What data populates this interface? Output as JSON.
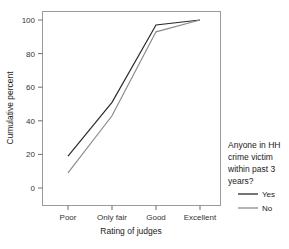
{
  "chart_data": {
    "type": "line",
    "title": "",
    "xlabel": "Rating of judges",
    "ylabel": "Cumulative percent",
    "categories": [
      "Poor",
      "Only fair",
      "Good",
      "Excellent"
    ],
    "ylim": [
      0,
      100
    ],
    "yticks": [
      0,
      20,
      40,
      60,
      80,
      100
    ],
    "ytick_labels": [
      "0",
      "20",
      "40",
      "60",
      "80",
      "100"
    ],
    "grid": false,
    "legend_position": "right",
    "legend_title": "Anyone in HH crime victim within past 3 years?",
    "series": [
      {
        "name": "Yes",
        "color": "#2b2b2b",
        "values": [
          19,
          51,
          97,
          100
        ]
      },
      {
        "name": "No",
        "color": "#8c8c8c",
        "values": [
          9,
          43,
          93,
          100
        ]
      }
    ]
  },
  "axes": {
    "y_tick_0": "0",
    "y_tick_1": "20",
    "y_tick_2": "40",
    "y_tick_3": "60",
    "y_tick_4": "80",
    "y_tick_5": "100",
    "x_tick_0": "Poor",
    "x_tick_1": "Only fair",
    "x_tick_2": "Good",
    "x_tick_3": "Excellent",
    "x_title": "Rating of judges",
    "y_title": "Cumulative percent"
  },
  "legend": {
    "title_line_1": "Anyone in HH",
    "title_line_2": "crime victim",
    "title_line_3": "within past 3",
    "title_line_4": "years?",
    "entries": [
      {
        "label": "Yes",
        "color": "#2b2b2b"
      },
      {
        "label": "No",
        "color": "#8c8c8c"
      }
    ]
  }
}
